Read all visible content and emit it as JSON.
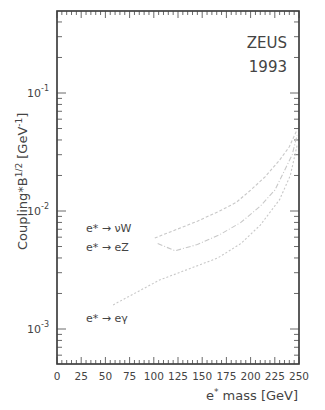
{
  "chart_data": {
    "type": "line",
    "title": "",
    "annotation": [
      "ZEUS",
      "1993"
    ],
    "xlabel": "e* mass  [GeV]",
    "ylabel": "Coupling*B^1/2 [GeV^-1]",
    "xlim": [
      0,
      250
    ],
    "ylim": [
      0.0005,
      0.5
    ],
    "yscale": "log",
    "grid": false,
    "x_ticks": [
      0,
      25,
      50,
      75,
      100,
      125,
      150,
      175,
      200,
      225,
      250
    ],
    "y_ticks": [
      "10^-3",
      "10^-2",
      "10^-1"
    ],
    "legend_position": "inline-left",
    "series": [
      {
        "name": "e* → νW",
        "x": [
          101,
          120,
          145,
          168,
          185,
          200,
          215,
          230,
          240,
          248
        ],
        "values": [
          0.0059,
          0.0068,
          0.0082,
          0.01,
          0.0118,
          0.015,
          0.0195,
          0.027,
          0.035,
          0.049
        ]
      },
      {
        "name": "e* → eZ",
        "x": [
          104,
          122,
          145,
          168,
          190,
          210,
          225,
          235,
          243,
          248
        ],
        "values": [
          0.0053,
          0.0046,
          0.0052,
          0.0063,
          0.008,
          0.011,
          0.015,
          0.022,
          0.03,
          0.044
        ]
      },
      {
        "name": "e* → eγ",
        "x": [
          58,
          80,
          106,
          135,
          166,
          190,
          210,
          230,
          241,
          248
        ],
        "values": [
          0.0016,
          0.002,
          0.0026,
          0.0032,
          0.004,
          0.0053,
          0.0076,
          0.0125,
          0.02,
          0.036
        ]
      }
    ]
  },
  "labels": {
    "experiment": "ZEUS",
    "year": "1993",
    "xlabel_main": "e",
    "xlabel_sup": "*",
    "xlabel_rest": " mass  [GeV]",
    "ylabel": "Coupling*B",
    "ylabel_sup": "1/2",
    "ylabel_unit": " [GeV",
    "ylabel_unit_sup": "-1",
    "ylabel_close": "]",
    "legend_nuW": "e* → νW",
    "legend_eZ": "e* → eZ",
    "legend_egamma": "e* → eγ"
  }
}
